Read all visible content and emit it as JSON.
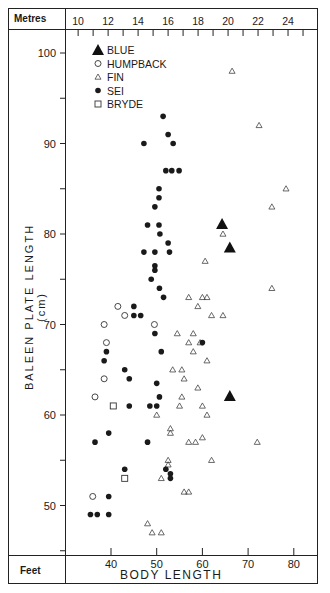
{
  "chart_data": {
    "type": "scatter",
    "title": "",
    "xlabel": "BODY LENGTH",
    "ylabel": "BALEEN PLATE LENGTH (cm)",
    "x_unit_bottom": "Feet",
    "x_unit_top": "Metres",
    "xlim": [
      27,
      85
    ],
    "ylim": [
      45,
      102
    ],
    "x_ticks_feet": [
      40,
      50,
      60,
      70,
      80
    ],
    "x_ticks_metres": [
      10,
      12,
      14,
      16,
      18,
      20,
      22,
      24
    ],
    "y_ticks": [
      50,
      60,
      70,
      80,
      90,
      100
    ],
    "grid": false,
    "legend_position": "upper-left",
    "series": [
      {
        "name": "BLUE",
        "marker": "filled-triangle",
        "points": [
          [
            64.3,
            81
          ],
          [
            66,
            78.4
          ],
          [
            66,
            62
          ]
        ]
      },
      {
        "name": "HUMPBACK",
        "marker": "open-circle",
        "points": [
          [
            41.5,
            72
          ],
          [
            43,
            71
          ],
          [
            38.5,
            70
          ],
          [
            39,
            68
          ],
          [
            38.5,
            64
          ],
          [
            36.5,
            62
          ],
          [
            49.5,
            70
          ],
          [
            36,
            51
          ]
        ]
      },
      {
        "name": "FIN",
        "marker": "open-triangle",
        "points": [
          [
            66.5,
            98
          ],
          [
            72.4,
            92
          ],
          [
            78.3,
            85
          ],
          [
            75.2,
            83
          ],
          [
            64.5,
            80
          ],
          [
            60.6,
            77
          ],
          [
            75.2,
            74
          ],
          [
            57,
            73
          ],
          [
            60,
            73
          ],
          [
            61,
            73
          ],
          [
            59,
            72
          ],
          [
            62,
            71
          ],
          [
            64.5,
            71
          ],
          [
            54.5,
            69
          ],
          [
            58,
            69
          ],
          [
            57,
            68
          ],
          [
            59.5,
            68
          ],
          [
            58,
            67
          ],
          [
            61,
            66
          ],
          [
            53.5,
            65
          ],
          [
            55.5,
            65
          ],
          [
            56,
            64
          ],
          [
            59,
            63
          ],
          [
            61,
            60
          ],
          [
            60,
            61
          ],
          [
            50,
            60
          ],
          [
            55,
            61
          ],
          [
            55.5,
            62
          ],
          [
            53,
            58.5
          ],
          [
            53,
            58
          ],
          [
            58.5,
            57
          ],
          [
            57,
            57
          ],
          [
            60,
            57.5
          ],
          [
            72,
            57
          ],
          [
            62,
            55
          ],
          [
            52.5,
            55
          ],
          [
            52.5,
            54.5
          ],
          [
            51,
            53
          ],
          [
            56,
            51.5
          ],
          [
            57,
            51.5
          ],
          [
            48,
            48
          ],
          [
            49,
            47
          ],
          [
            51,
            47
          ]
        ]
      },
      {
        "name": "SEI",
        "marker": "filled-circle",
        "points": [
          [
            51.4,
            93
          ],
          [
            52.5,
            91
          ],
          [
            47.2,
            90
          ],
          [
            53.6,
            90
          ],
          [
            52,
            87
          ],
          [
            53.3,
            87
          ],
          [
            54.9,
            87
          ],
          [
            50.5,
            85
          ],
          [
            50.5,
            84
          ],
          [
            49.6,
            83
          ],
          [
            48,
            81
          ],
          [
            50.5,
            81
          ],
          [
            50.7,
            80
          ],
          [
            52.5,
            79
          ],
          [
            47.2,
            78
          ],
          [
            49.6,
            78
          ],
          [
            52.8,
            78
          ],
          [
            49.6,
            76.5
          ],
          [
            49.6,
            76
          ],
          [
            48.8,
            75
          ],
          [
            50.6,
            74
          ],
          [
            51.5,
            73
          ],
          [
            45,
            72
          ],
          [
            45,
            71
          ],
          [
            46.5,
            71
          ],
          [
            39,
            67
          ],
          [
            51,
            67
          ],
          [
            49.6,
            69
          ],
          [
            38.5,
            66
          ],
          [
            43,
            65
          ],
          [
            50,
            63.5
          ],
          [
            44,
            64
          ],
          [
            50.6,
            62
          ],
          [
            44,
            61
          ],
          [
            39.5,
            58
          ],
          [
            36.5,
            57
          ],
          [
            48,
            57
          ],
          [
            48.5,
            61
          ],
          [
            52,
            54
          ],
          [
            53,
            53.5
          ],
          [
            53,
            53
          ],
          [
            43,
            54
          ],
          [
            39.5,
            51
          ],
          [
            35.5,
            49
          ],
          [
            37,
            49
          ],
          [
            39.5,
            49
          ],
          [
            50,
            61
          ],
          [
            60,
            68
          ]
        ]
      },
      {
        "name": "BRYDE",
        "marker": "open-square",
        "points": [
          [
            40.5,
            61
          ],
          [
            43,
            53
          ]
        ]
      }
    ]
  },
  "axes": {
    "metres_label": "Metres",
    "feet_label": "Feet",
    "xlabel": "BODY LENGTH",
    "ylabel": "BALEEN   PLATE   LENGTH   (cm)"
  }
}
